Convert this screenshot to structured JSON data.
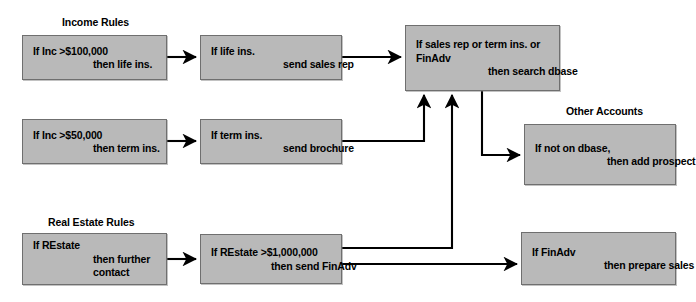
{
  "diagram": {
    "colors": {
      "box_fill": "#b9b9b9",
      "box_border": "#6f6f6f",
      "edge": "#000000",
      "background": "#ffffff",
      "text": "#000000"
    },
    "groups": [
      {
        "id": "income-rules",
        "label": "Income Rules"
      },
      {
        "id": "other-accounts",
        "label": "Other Accounts"
      },
      {
        "id": "real-estate-rules",
        "label": "Real Estate Rules"
      }
    ],
    "nodes": [
      {
        "id": "inc-100k",
        "group": "income-rules",
        "lines": [
          "If Inc >$100,000",
          "then life ins."
        ],
        "indents": [
          0,
          3
        ]
      },
      {
        "id": "life-ins",
        "group": "income-rules",
        "lines": [
          "If life ins.",
          "send sales rep"
        ],
        "indents": [
          0,
          3
        ]
      },
      {
        "id": "inc-50k",
        "group": "income-rules",
        "lines": [
          "If Inc >$50,000",
          "then term ins."
        ],
        "indents": [
          0,
          3
        ]
      },
      {
        "id": "term-ins",
        "group": "income-rules",
        "lines": [
          "If term ins.",
          "send brochure"
        ],
        "indents": [
          0,
          3
        ]
      },
      {
        "id": "search-dbase",
        "group": null,
        "lines": [
          "If sales rep or term ins. or",
          "FinAdv",
          "then search dbase"
        ],
        "indents": [
          0,
          0,
          3
        ]
      },
      {
        "id": "prospect-file",
        "group": "other-accounts",
        "lines": [
          "If not on dbase,",
          "then add prospect file"
        ],
        "indents": [
          0,
          3
        ]
      },
      {
        "id": "restate",
        "group": "real-estate-rules",
        "lines": [
          "If REstate",
          "then further",
          "contact"
        ],
        "indents": [
          0,
          3,
          3
        ]
      },
      {
        "id": "restate-1m",
        "group": "real-estate-rules",
        "lines": [
          "If REstate >$1,000,000",
          "then send FinAdv"
        ],
        "indents": [
          0,
          3
        ]
      },
      {
        "id": "sales-kit",
        "group": null,
        "lines": [
          "If FinAdv",
          "then prepare sales kit"
        ],
        "indents": [
          0,
          3
        ]
      }
    ],
    "edges": [
      {
        "id": "e1",
        "from": "inc-100k",
        "to": "life-ins",
        "arrow": true
      },
      {
        "id": "e2",
        "from": "life-ins",
        "to": "search-dbase",
        "arrow": true
      },
      {
        "id": "e3",
        "from": "inc-50k",
        "to": "term-ins",
        "arrow": true
      },
      {
        "id": "e4",
        "from": "term-ins",
        "to": "search-dbase",
        "arrow": true
      },
      {
        "id": "e5",
        "from": "search-dbase",
        "to": "prospect-file",
        "arrow": true
      },
      {
        "id": "e6",
        "from": "restate",
        "to": "restate-1m",
        "arrow": true
      },
      {
        "id": "e7",
        "from": "restate-1m",
        "to": "search-dbase",
        "arrow": true
      },
      {
        "id": "e8",
        "from": "restate-1m",
        "to": "sales-kit",
        "arrow": true
      }
    ]
  }
}
